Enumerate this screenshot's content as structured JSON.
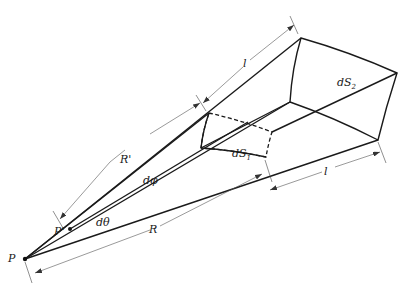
{
  "figure": {
    "type": "solid-angle-cone-diagram",
    "labels": {
      "point_P": "P",
      "point_P_prime": "P'",
      "dist_R_prime": "R'",
      "dist_R": "R",
      "length_l_top": "l",
      "length_l_bottom": "l",
      "angle_dphi": "dφ",
      "angle_dtheta": "dθ",
      "surface_dS1": "dS",
      "surface_dS1_sub": "1",
      "surface_dS2": "dS",
      "surface_dS2_sub": "2"
    },
    "colors": {
      "line": "#1a1a1a",
      "stipple": "#8a8a8a",
      "dimension": "#555555",
      "background": "#ffffff"
    }
  }
}
